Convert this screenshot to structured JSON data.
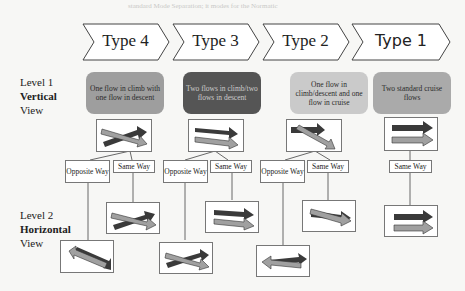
{
  "background_text": "standard Mode Separation; it modes for the Normatic",
  "types": [
    {
      "label": "Type 4"
    },
    {
      "label": "Type 3"
    },
    {
      "label": "Type 2"
    },
    {
      "label": "Type 1"
    }
  ],
  "levels": {
    "level1": {
      "line1": "Level 1",
      "line2": "Vertical",
      "line3": "View"
    },
    "level2": {
      "line1": "Level 2",
      "line2": "Horizontal",
      "line3": "View"
    }
  },
  "descriptions": [
    {
      "text": "One flow in climb with one flow in descent",
      "color": "#9e9e9e"
    },
    {
      "text": "Two flows in climb/two flows in descent",
      "color": "#555555"
    },
    {
      "text": "One flow in climb/descent and one flow in cruise",
      "color": "#c9c9c9"
    },
    {
      "text": "Two standard cruise flows",
      "color": "#a9a9a9"
    }
  ],
  "branch_labels": {
    "opposite": "Opposite Way",
    "same": "Same Way"
  },
  "colors": {
    "dark_arrow": "#3a3a3a",
    "light_arrow": "#a0a0a0",
    "border": "#777777"
  }
}
